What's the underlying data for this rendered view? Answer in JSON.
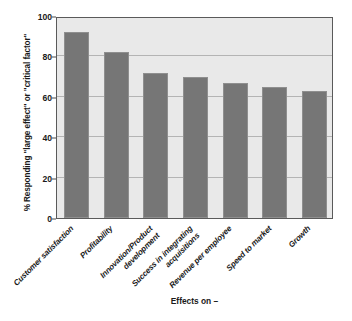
{
  "chart_data": {
    "type": "bar",
    "title": "",
    "subtitle": "",
    "xlabel": "Effects on –",
    "ylabel": "% Responding \"large effect\" or \"critical factor\"",
    "categories": [
      "Customer satisfaction",
      "Profitability",
      "Innovation/Product\ndevelopment",
      "Success in integrating\nacquisitions",
      "Revenue per employee",
      "Speed to market",
      "Growth"
    ],
    "values": [
      92,
      82,
      72,
      70,
      67,
      65,
      63
    ],
    "ylim": [
      0,
      100
    ],
    "yticks": [
      0,
      20,
      40,
      60,
      80,
      100
    ],
    "ytick_labels": [
      "0",
      "20",
      "40",
      "60",
      "80",
      "100"
    ],
    "grid": true,
    "legend": false,
    "legend_position": "none",
    "colors": {
      "bar_fill": "#767676",
      "bar_edge": "#8f8f8f",
      "plot_background": "#e9e9e9",
      "page_background": "#ffffff",
      "gridline": "#b4b4b4",
      "frame": "#5a5a5a",
      "text": "#1a1a1a"
    }
  }
}
